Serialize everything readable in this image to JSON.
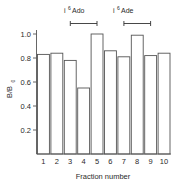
{
  "chart_data": {
    "type": "bar",
    "title": "",
    "xlabel": "Fraction number",
    "ylabel": "B/B0",
    "ylabel_display": "B/B",
    "ylabel_sub": "0",
    "categories": [
      "1",
      "2",
      "3",
      "4",
      "5",
      "6",
      "7",
      "8",
      "9",
      "10"
    ],
    "values": [
      0.83,
      0.84,
      0.78,
      0.55,
      1.0,
      0.86,
      0.81,
      0.99,
      0.82,
      0.84
    ],
    "ylim": [
      0,
      1.06
    ],
    "yticks": [
      "1.0",
      "0.8",
      "0.6",
      "0.4",
      "0.2"
    ],
    "ytick_values": [
      1.0,
      0.8,
      0.6,
      0.4,
      0.2
    ],
    "xlim": [
      0.5,
      10.5
    ],
    "grid": false,
    "legend": "none",
    "bar_fill": "#ffffff",
    "bar_edge": "#555555",
    "axis_color": "#555555",
    "text_color": "#2a2a2a",
    "annotations": [
      {
        "label_prefix": "i",
        "label_sup": "6",
        "label_suffix": "Ado",
        "label_full": "i6 Ado",
        "x_start": 3,
        "x_end": 5
      },
      {
        "label_prefix": "i",
        "label_sup": "6",
        "label_suffix": "Ade",
        "label_full": "i6 Ade",
        "x_start": 7,
        "x_end": 9
      }
    ]
  }
}
